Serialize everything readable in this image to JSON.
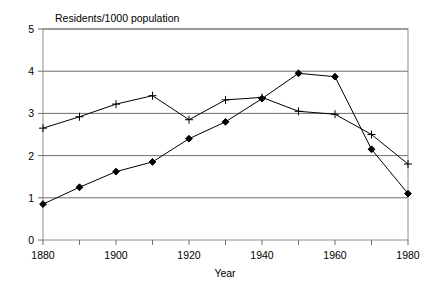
{
  "chart_data": {
    "type": "line",
    "title": "Residents/1000 population",
    "xlabel": "Year",
    "ylabel": "",
    "x": [
      1880,
      1890,
      1900,
      1910,
      1920,
      1930,
      1940,
      1950,
      1960,
      1970,
      1980
    ],
    "xlim": [
      1880,
      1980
    ],
    "ylim": [
      0,
      5
    ],
    "xticks": [
      1880,
      1890,
      1900,
      1910,
      1920,
      1930,
      1940,
      1950,
      1960,
      1970,
      1980
    ],
    "xticklabels": [
      "1880",
      "",
      "1900",
      "",
      "1920",
      "",
      "1940",
      "",
      "1960",
      "",
      "1980"
    ],
    "yticks": [
      0,
      1,
      2,
      3,
      4,
      5
    ],
    "yticklabels": [
      "0",
      "1",
      "2",
      "3",
      "4",
      "5"
    ],
    "grid": "horizontal",
    "legend": "none",
    "series": [
      {
        "name": "plus-series",
        "marker": "plus",
        "color": "#000000",
        "values": [
          2.65,
          2.92,
          3.22,
          3.42,
          2.85,
          3.32,
          3.38,
          3.05,
          2.98,
          2.5,
          1.8
        ]
      },
      {
        "name": "diamond-series",
        "marker": "diamond",
        "color": "#000000",
        "values": [
          0.85,
          1.25,
          1.62,
          1.85,
          2.4,
          2.8,
          3.35,
          3.95,
          3.87,
          2.15,
          1.1
        ]
      }
    ]
  },
  "axes": {
    "title": "Residents/1000 population",
    "x_axis_title": "Year",
    "y_axis_values": [
      "5",
      "4",
      "3",
      "2",
      "1",
      "0"
    ],
    "x_axis_values": [
      "1880",
      "1900",
      "1920",
      "1940",
      "1960",
      "1980"
    ]
  },
  "colors": {
    "line": "#333333",
    "grid": "#666666",
    "frame": "#808080",
    "text": "#000000",
    "background": "#ffffff"
  }
}
